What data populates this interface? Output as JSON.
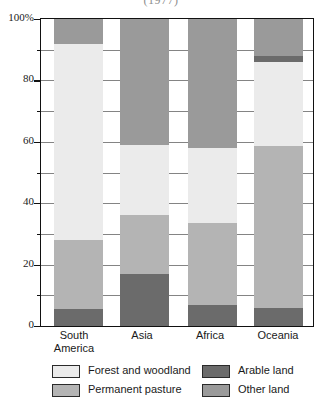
{
  "chart_data": {
    "type": "bar",
    "title": "(1977)",
    "subtitle": "",
    "xlabel": "",
    "ylabel": "",
    "stacked": true,
    "percent_stacked": true,
    "grid": true,
    "legend_position": "bottom",
    "ylim": [
      0,
      100
    ],
    "yticks": [
      0,
      20,
      40,
      60,
      80,
      100
    ],
    "ytick_labels": [
      "0",
      "20",
      "40",
      "60",
      "80",
      "100%"
    ],
    "yticks_minor": [
      10,
      30,
      50,
      70,
      90
    ],
    "categories": [
      "South\nAmerica",
      "Asia",
      "Africa",
      "Oceania"
    ],
    "category_labels_flat": [
      "South America",
      "Asia",
      "Africa",
      "Oceania"
    ],
    "series": [
      {
        "name": "Arable land",
        "color": "#6b6b6b",
        "values": [
          5.5,
          17.0,
          7.0,
          6.0
        ]
      },
      {
        "name": "Permanent pasture",
        "color": "#b4b4b4",
        "values": [
          22.5,
          19.0,
          26.5,
          52.5
        ]
      },
      {
        "name": "Forest and woodland",
        "color": "#ebebeb",
        "values": [
          64.0,
          23.0,
          24.5,
          27.5
        ]
      },
      {
        "name": "Other land",
        "color": "#9a9a9a",
        "values": [
          8.0,
          41.0,
          42.0,
          14.0
        ]
      }
    ],
    "extra_segments": [
      {
        "category": "Oceania",
        "series": "Arable land",
        "from": 86.0,
        "to": 88.0,
        "note": "thin dark band below other land"
      }
    ]
  },
  "legend": {
    "items": [
      {
        "label": "Forest and woodland",
        "color": "#ebebeb",
        "key": "forest-and-woodland"
      },
      {
        "label": "Permanent pasture",
        "color": "#b4b4b4",
        "key": "permanent-pasture"
      },
      {
        "label": "Arable land",
        "color": "#6b6b6b",
        "key": "arable-land"
      },
      {
        "label": "Other land",
        "color": "#9a9a9a",
        "key": "other-land"
      }
    ]
  },
  "axis": {
    "y": {
      "labels": [
        "100%",
        "80",
        "60",
        "40",
        "20",
        "0"
      ],
      "values": [
        100,
        80,
        60,
        40,
        20,
        0
      ]
    },
    "x": {
      "labels": [
        "South\nAmerica",
        "Asia",
        "Africa",
        "Oceania"
      ]
    }
  }
}
